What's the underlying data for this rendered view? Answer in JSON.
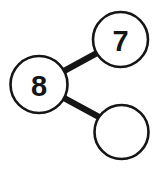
{
  "diagram": {
    "type": "number-bond",
    "canvas": {
      "width": 155,
      "height": 170,
      "background": "#ffffff"
    },
    "style": {
      "stroke_color": "#151515",
      "node_fill": "#ffffff",
      "node_stroke_width": 2.6,
      "edge_color": "#151515",
      "edge_stroke_width": 6.4,
      "label_color": "#151515",
      "label_font_size": 29
    },
    "nodes": [
      {
        "id": "whole",
        "label": "8",
        "has_label": true,
        "role": "whole",
        "cx": 39,
        "cy": 84.5,
        "r": 28.5
      },
      {
        "id": "part-top",
        "label": "7",
        "has_label": true,
        "role": "part",
        "cx": 120.5,
        "cy": 39.5,
        "r": 27.5
      },
      {
        "id": "part-bottom",
        "label": "",
        "has_label": false,
        "role": "part-blank",
        "cx": 121.5,
        "cy": 132,
        "r": 27
      }
    ],
    "edges": [
      {
        "id": "edge-whole-top",
        "from": "whole",
        "to": "part-top",
        "x1": 64,
        "y1": 71,
        "x2": 97,
        "y2": 53
      },
      {
        "id": "edge-whole-bottom",
        "from": "whole",
        "to": "part-bottom",
        "x1": 64,
        "y1": 98,
        "x2": 99,
        "y2": 117
      }
    ]
  }
}
